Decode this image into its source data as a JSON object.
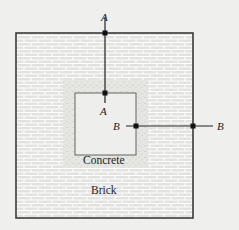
{
  "diagram": {
    "materials": {
      "outer": "Brick",
      "inner": "Concrete"
    },
    "sections": {
      "a": {
        "top_label": "A",
        "bottom_label": "A"
      },
      "b": {
        "left_label": "B",
        "right_label": "B"
      }
    },
    "colors": {
      "background": "#efefed",
      "brick_fill": "#e4e4e2",
      "brick_lines": "#ffffff",
      "concrete_fill": "#e2e2df",
      "hollow_fill": "#efefed",
      "outline": "#333333"
    }
  }
}
